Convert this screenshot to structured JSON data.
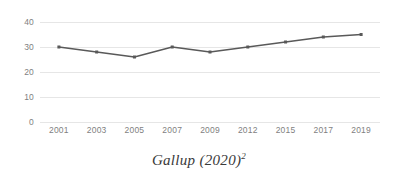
{
  "caption": {
    "text": "Gallup (2020)",
    "superscript": "2"
  },
  "chart_data": {
    "type": "line",
    "title": "",
    "subtitle": "",
    "xlabel": "",
    "ylabel": "",
    "categories": [
      "2001",
      "2003",
      "2005",
      "2007",
      "2009",
      "2012",
      "2015",
      "2017",
      "2019"
    ],
    "values": [
      30,
      28,
      26,
      30,
      28,
      30,
      32,
      34,
      35
    ],
    "series": [
      {
        "name": "",
        "values": [
          30,
          28,
          26,
          30,
          28,
          30,
          32,
          34,
          35
        ],
        "color": "#595959",
        "marker": "square"
      }
    ],
    "ylim": [
      0,
      40
    ],
    "yticks": [
      0,
      10,
      20,
      30,
      40
    ],
    "ytick_labels": [
      "0",
      "10",
      "20",
      "30",
      "40"
    ],
    "grid": {
      "horizontal": true,
      "vertical": false,
      "color": "#e6e6e6"
    },
    "legend": {
      "visible": false,
      "position": "none"
    },
    "axis_label_color": "#7f7f7f",
    "background": "#ffffff"
  }
}
